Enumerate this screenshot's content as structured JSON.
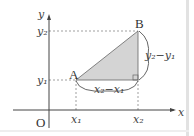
{
  "diagram": {
    "axes": {
      "x_label": "x",
      "y_label": "y",
      "origin_label": "O"
    },
    "points": {
      "A": {
        "label": "A",
        "x_label": "x₁",
        "y_label": "y₁"
      },
      "B": {
        "label": "B",
        "x_label": "x₂",
        "y_label": "y₂"
      }
    },
    "braces": {
      "horizontal": "x₂−x₁",
      "vertical": "y₂−y₁"
    },
    "colors": {
      "fill": "#d4d4d4",
      "axis": "#444444",
      "dash": "#666666",
      "border": "#dddddd"
    }
  }
}
